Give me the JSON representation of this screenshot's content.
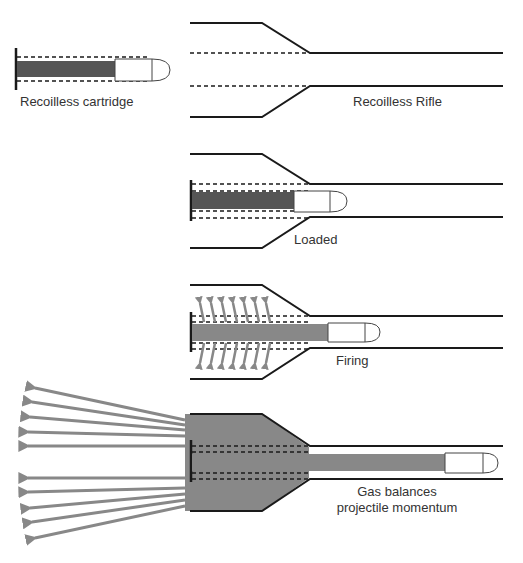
{
  "diagram": {
    "colors": {
      "outline": "#1a1a1a",
      "propellant_dark": "#555555",
      "gas": "#888888",
      "projectile_fill": "#ffffff",
      "text": "#333333"
    },
    "panels": [
      {
        "id": "cartridge",
        "label": "Recoilless cartridge"
      },
      {
        "id": "rifle",
        "label": "Recoilless Rifle"
      },
      {
        "id": "loaded",
        "label": "Loaded"
      },
      {
        "id": "firing",
        "label": "Firing"
      },
      {
        "id": "balanced",
        "label_line1": "Gas balances",
        "label_line2": "projectile momentum"
      }
    ]
  }
}
